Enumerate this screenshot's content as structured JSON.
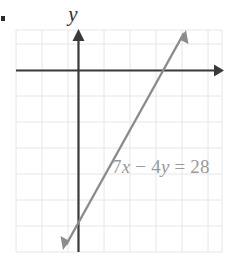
{
  "figure": {
    "bullet": "•",
    "axis_label_y": "y",
    "equation_text": "7x − 4y = 28",
    "equation_parts": {
      "coef_x": "7",
      "var_x": "x",
      "minus": "−",
      "coef_y": "4",
      "var_y": "y",
      "equals": "=",
      "constant": "28"
    },
    "colors": {
      "grid": "#e3e3e3",
      "axis": "#3a3a3a",
      "line": "#8c8c8c",
      "equation_text": "#9a9a9a",
      "label_text": "#2f2f2f",
      "background": "#ffffff"
    }
  },
  "chart_data": {
    "type": "line",
    "title": "",
    "xlabel": "",
    "ylabel": "y",
    "grid": true,
    "legend": "none",
    "annotations": [
      {
        "text": "7x − 4y = 28",
        "x_px": 112,
        "y_px": 168
      }
    ],
    "axes": {
      "x_axis_px_y": 70,
      "y_axis_px_x": 78,
      "grid_left_px": 16,
      "grid_right_px": 222,
      "grid_top_px": 30,
      "grid_bottom_px": 252,
      "grid_spacing_px": 26,
      "x_columns": 8,
      "y_rows": 9,
      "xlim": [
        -2.4,
        5.5
      ],
      "ylim": [
        -7.0,
        1.5
      ],
      "xticks": [
        -2,
        -1,
        0,
        1,
        2,
        3,
        4,
        5
      ],
      "yticks": [
        -7,
        -6,
        -5,
        -4,
        -3,
        -2,
        -1,
        0,
        1
      ]
    },
    "series": [
      {
        "name": "7x − 4y = 28",
        "equation": "7x - 4y = 28",
        "slope": 1.75,
        "y_intercept": -7,
        "x_intercept": 4,
        "points": [
          {
            "x": 0,
            "y": -7
          },
          {
            "x": 4,
            "y": 0
          }
        ],
        "endpoints_px": [
          {
            "x": 64,
            "y": 248
          },
          {
            "x": 186,
            "y": 30
          }
        ],
        "arrows": "both"
      }
    ]
  }
}
